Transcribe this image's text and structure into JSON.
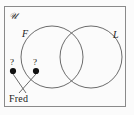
{
  "figure": {
    "type": "venn-diagram",
    "universe_label": "U",
    "universe_glyph": "𝒰",
    "background_color": "#fbfbfb",
    "border_color": "#8a8a8a",
    "stroke_color": "#5a5a5a",
    "marker_color": "#111111",
    "text_color": "#1a1a1a"
  },
  "sets": [
    {
      "id": "F",
      "label": "F",
      "cx": 52,
      "cy": 57,
      "r": 31
    },
    {
      "id": "L",
      "label": "L",
      "cx": 91,
      "cy": 57,
      "r": 31
    }
  ],
  "markers": [
    {
      "id": "marker-left",
      "question": "?",
      "x": 13,
      "y": 71,
      "r": 3.1
    },
    {
      "id": "marker-right",
      "question": "?",
      "x": 36,
      "y": 71,
      "r": 3.1
    }
  ],
  "leaders": [
    {
      "id": "leader-left",
      "from_x": 13,
      "from_y": 74,
      "to_x": 26,
      "to_y": 93
    },
    {
      "id": "leader-right",
      "from_x": 36,
      "from_y": 74,
      "to_x": 19,
      "to_y": 93
    }
  ],
  "annotation": {
    "name_label": "Fred"
  },
  "frame": {
    "x": 4,
    "y": 6,
    "width": 122,
    "height": 101
  }
}
